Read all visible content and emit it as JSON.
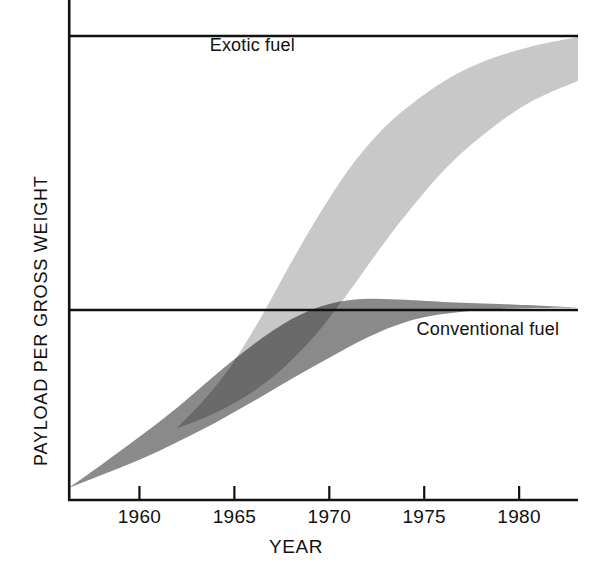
{
  "chart_data": {
    "type": "area",
    "title": "",
    "subtitle": "",
    "xlabel": "YEAR",
    "ylabel": "PAYLOAD PER GROSS WEIGHT",
    "xlim": [
      1956.3,
      1983.1
    ],
    "ylim": [
      0,
      1.0
    ],
    "grid": false,
    "gridlines_y": [
      0.38,
      0.92
    ],
    "legend_position": "inline-annotation",
    "xticks": [
      1960,
      1965,
      1970,
      1975,
      1980
    ],
    "xtick_labels": [
      "1960",
      "1965",
      "1970",
      "1975",
      "1980"
    ],
    "yticks": [],
    "ytick_labels": [],
    "series": [
      {
        "name": "Conventional fuel",
        "kind": "band",
        "fill": "#8a8a8a",
        "label": "Conventional fuel",
        "label_x": 1974.6,
        "label_y": 0.345,
        "x": [
          1956.3,
          1958.0,
          1960.0,
          1962.0,
          1964.0,
          1966.0,
          1968.0,
          1970.0,
          1972.0,
          1974.0,
          1976.0,
          1979.0,
          1983.1
        ],
        "upper": [
          0.03,
          0.075,
          0.13,
          0.188,
          0.252,
          0.312,
          0.362,
          0.392,
          0.402,
          0.4,
          0.396,
          0.392,
          0.385
        ],
        "lower": [
          0.03,
          0.055,
          0.085,
          0.12,
          0.158,
          0.2,
          0.244,
          0.286,
          0.326,
          0.356,
          0.372,
          0.382,
          0.385
        ]
      },
      {
        "name": "Exotic fuel",
        "kind": "band",
        "fill": "#c8c8c8",
        "label": "Exotic fuel",
        "label_x": 1963.7,
        "label_y": 0.905,
        "x": [
          1961.9,
          1963.5,
          1965.0,
          1966.5,
          1968.0,
          1969.5,
          1971.0,
          1972.5,
          1974.0,
          1976.0,
          1978.0,
          1980.5,
          1983.1
        ],
        "upper": [
          0.145,
          0.208,
          0.28,
          0.372,
          0.474,
          0.57,
          0.656,
          0.724,
          0.776,
          0.83,
          0.868,
          0.898,
          0.918
        ],
        "lower": [
          0.145,
          0.168,
          0.196,
          0.232,
          0.28,
          0.34,
          0.414,
          0.492,
          0.566,
          0.654,
          0.722,
          0.788,
          0.832
        ]
      }
    ],
    "overlap_fill": "#6a6a6a"
  },
  "axes": {
    "xaxis_title": "YEAR",
    "yaxis_title": "PAYLOAD PER GROSS WEIGHT",
    "ticks": [
      {
        "label": "1960",
        "value": 1960
      },
      {
        "label": "1965",
        "value": 1965
      },
      {
        "label": "1970",
        "value": 1970
      },
      {
        "label": "1975",
        "value": 1975
      },
      {
        "label": "1980",
        "value": 1980
      }
    ]
  },
  "annotations": {
    "exotic_label": "Exotic fuel",
    "conventional_label": "Conventional fuel"
  },
  "colors": {
    "axis": "#111111",
    "band_conventional": "#8a8a8a",
    "band_exotic": "#c8c8c8",
    "band_overlap": "#6a6a6a",
    "background": "#ffffff"
  }
}
